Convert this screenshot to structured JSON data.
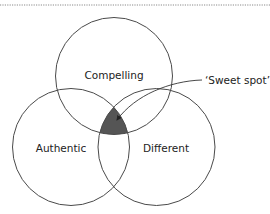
{
  "diagram": {
    "type": "venn",
    "top_rule": {
      "style": "dotted",
      "color": "#8a8a8a"
    },
    "circles": [
      {
        "id": "compelling",
        "label": "Compelling",
        "cx": 114,
        "cy": 76,
        "r": 58.5
      },
      {
        "id": "authentic",
        "label": "Authentic",
        "cx": 71,
        "cy": 147,
        "r": 58.5
      },
      {
        "id": "different",
        "label": "Different",
        "cx": 156.5,
        "cy": 147,
        "r": 58.5
      }
    ],
    "intersection": {
      "label": "‘Sweet spot’",
      "fill": "#555555"
    },
    "stroke_color": "#4a4a4a"
  }
}
